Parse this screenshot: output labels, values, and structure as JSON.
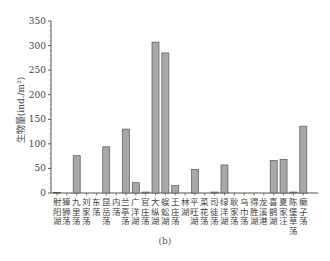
{
  "chart_data": {
    "type": "bar",
    "title": "",
    "xlabel": "",
    "ylabel": "生物量(ind./m²)",
    "ylim": [
      0,
      350
    ],
    "yticks": [
      0,
      50,
      100,
      150,
      200,
      250,
      300,
      350
    ],
    "grid": false,
    "legend": null,
    "bar_color": "#a8a8a8",
    "bar_edge_color": "#555555",
    "categories": [
      "射阳湖",
      "獐狮荡",
      "九里荡",
      "刘家荡",
      "东荡",
      "昆岳荡",
      "内荡",
      "兰亭荡",
      "广洋湖",
      "官庄荡",
      "大纵湖",
      "蜈蚣湖",
      "王庄荡",
      "林湖",
      "平旺湖",
      "菜花荡",
      "司徒荡",
      "绿洋湖",
      "耿家荡",
      "乌巾荡",
      "得胜湖",
      "龙溪港",
      "喜鹊湖",
      "夏家汪",
      "陈堡草荡",
      "癞子荡"
    ],
    "values": [
      1,
      0,
      76,
      0,
      0,
      94,
      0,
      130,
      21,
      2,
      307,
      285,
      15,
      0,
      48,
      0,
      2,
      57,
      0,
      0,
      0,
      0,
      66,
      68,
      2,
      136
    ]
  },
  "caption": "(b)"
}
